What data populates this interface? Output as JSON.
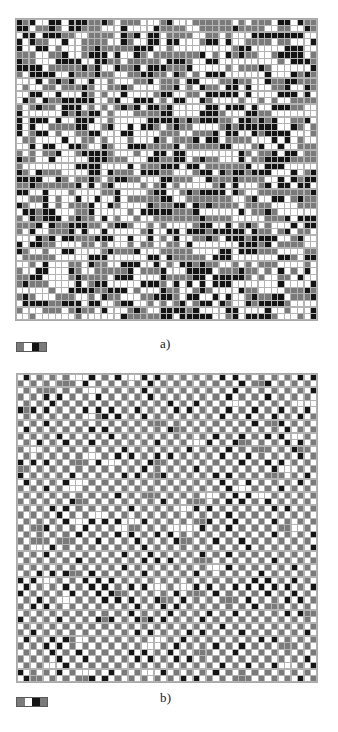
{
  "figure": {
    "background_color": "#ffffff",
    "panel_count": 2
  },
  "palette": {
    "white": "#ffffff",
    "gray": "#7a7a7a",
    "black": "#141414",
    "grid_line": "#b3b3b3",
    "frame": "#a8a8a8",
    "text": "#1a1a1a"
  },
  "panels": [
    {
      "id": "a",
      "label": "a)",
      "grid": {
        "name": "disordered-lattice",
        "columns": 46,
        "rows": 46,
        "cell_px": 6.55,
        "pattern": "random",
        "states": [
          "white",
          "gray",
          "black"
        ],
        "state_weights": [
          0.4,
          0.3,
          0.3
        ],
        "seed": 20240517,
        "description": "Random / disordered three-state configuration"
      },
      "legend": {
        "name": "colorbar-a",
        "segments": [
          "#7a7a7a",
          "#ffffff",
          "#141414",
          "#7a7a7a"
        ],
        "segment_count": 4
      }
    },
    {
      "id": "b",
      "label": "b)",
      "grid": {
        "name": "ordered-checkerboard-lattice",
        "columns": 46,
        "rows": 47,
        "cell_px": 6.55,
        "pattern": "checkerboard",
        "states": [
          "white",
          "gray",
          "black"
        ],
        "sublattice_a": "white",
        "sublattice_b_states": [
          "gray",
          "black"
        ],
        "sublattice_b_weights": [
          0.72,
          0.28
        ],
        "seed": 77711,
        "description": "Ordered antiferromagnetic checkerboard configuration"
      },
      "legend": {
        "name": "colorbar-b",
        "segments": [
          "#7a7a7a",
          "#ffffff",
          "#141414",
          "#7a7a7a"
        ],
        "segment_count": 4
      }
    }
  ],
  "chart_data": {
    "type": "heatmap",
    "xlabel": "",
    "ylabel": "",
    "grid": true,
    "legend_position": "below-left",
    "subplots": [
      {
        "label": "a)",
        "type": "heatmap",
        "nx": 46,
        "ny": 46,
        "value_levels": [
          0,
          1,
          2
        ],
        "level_colors": [
          "#ffffff",
          "#7a7a7a",
          "#141414"
        ],
        "level_fractions": [
          0.4,
          0.3,
          0.3
        ],
        "spatial_order": "random",
        "colorbar_segments": [
          "#7a7a7a",
          "#ffffff",
          "#141414",
          "#7a7a7a"
        ]
      },
      {
        "label": "b)",
        "type": "heatmap",
        "nx": 46,
        "ny": 47,
        "value_levels": [
          0,
          1,
          2
        ],
        "level_colors": [
          "#ffffff",
          "#7a7a7a",
          "#141414"
        ],
        "level_fractions": [
          0.5,
          0.36,
          0.14
        ],
        "spatial_order": "checkerboard",
        "colorbar_segments": [
          "#7a7a7a",
          "#ffffff",
          "#141414",
          "#7a7a7a"
        ]
      }
    ]
  }
}
